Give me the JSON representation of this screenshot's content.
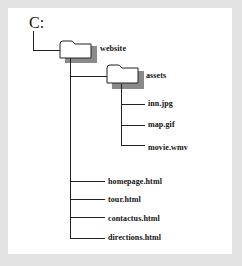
{
  "diagram": {
    "type": "directory-tree",
    "root": {
      "label": "C:",
      "children": [
        {
          "label": "website",
          "type": "folder",
          "children": [
            {
              "label": "assets",
              "type": "folder",
              "children": [
                {
                  "label": "inn.jpg",
                  "type": "file"
                },
                {
                  "label": "map.gif",
                  "type": "file"
                },
                {
                  "label": "movie.wmv",
                  "type": "file"
                }
              ]
            },
            {
              "label": "homepage.html",
              "type": "file"
            },
            {
              "label": "tour.html",
              "type": "file"
            },
            {
              "label": "contactus.html",
              "type": "file"
            },
            {
              "label": "directions.html",
              "type": "file"
            }
          ]
        }
      ]
    }
  },
  "labels": {
    "drive": "C:",
    "website": "website",
    "assets": "assets",
    "inn": "inn.jpg",
    "map": "map.gif",
    "movie": "movie.wmv",
    "homepage": "homepage.html",
    "tour": "tour.html",
    "contactus": "contactus.html",
    "directions": "directions.html"
  },
  "colors": {
    "background": "#e3e3e3",
    "panel": "#ffffff",
    "line": "#222222",
    "folder_shadow": "#8a8a8a"
  }
}
